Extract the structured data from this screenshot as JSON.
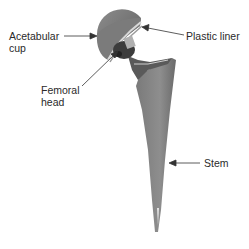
{
  "diagram": {
    "labels": {
      "acetabular_cup": [
        "Acetabular",
        "cup"
      ],
      "femoral_head": [
        "Femoral",
        "head"
      ],
      "plastic_liner": "Plastic liner",
      "stem": "Stem"
    },
    "colors": {
      "metal_dark": "#6e6e6e",
      "metal_mid": "#8a8a8a",
      "metal_light": "#b8b8b8",
      "text": "#2a2a2a",
      "arrow": "#333333"
    }
  }
}
